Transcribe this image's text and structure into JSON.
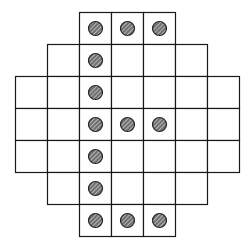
{
  "diagram": {
    "type": "peg-board-grid",
    "rows": 7,
    "cols": 7,
    "cell_size": 32,
    "origin": {
      "x": 15,
      "y": 12
    },
    "line_color": "#1a1a1a",
    "peg_fill": "#6e6e6e",
    "peg_hatch": "#f0f0f0",
    "row_spans": [
      {
        "row": 0,
        "start_col": 2,
        "end_col": 4
      },
      {
        "row": 1,
        "start_col": 1,
        "end_col": 5
      },
      {
        "row": 2,
        "start_col": 0,
        "end_col": 6
      },
      {
        "row": 3,
        "start_col": 0,
        "end_col": 6
      },
      {
        "row": 4,
        "start_col": 0,
        "end_col": 6
      },
      {
        "row": 5,
        "start_col": 1,
        "end_col": 5
      },
      {
        "row": 6,
        "start_col": 2,
        "end_col": 4
      }
    ],
    "pegs": [
      {
        "row": 0,
        "col": 2
      },
      {
        "row": 0,
        "col": 3
      },
      {
        "row": 0,
        "col": 4
      },
      {
        "row": 1,
        "col": 2
      },
      {
        "row": 2,
        "col": 2
      },
      {
        "row": 3,
        "col": 2
      },
      {
        "row": 3,
        "col": 3
      },
      {
        "row": 3,
        "col": 4
      },
      {
        "row": 4,
        "col": 2
      },
      {
        "row": 5,
        "col": 2
      },
      {
        "row": 6,
        "col": 2
      },
      {
        "row": 6,
        "col": 3
      },
      {
        "row": 6,
        "col": 4
      }
    ]
  }
}
